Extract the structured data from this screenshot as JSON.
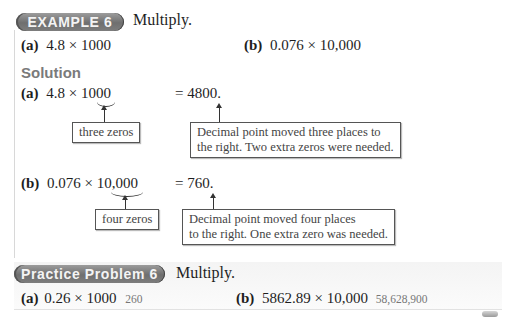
{
  "example": {
    "badge": "EXAMPLE 6",
    "instruction": "Multiply.",
    "parts": [
      {
        "label": "(a)",
        "expression": "4.8 × 1000"
      },
      {
        "label": "(b)",
        "expression": "0.076 × 10,000"
      }
    ]
  },
  "solution": {
    "heading": "Solution",
    "steps": [
      {
        "label": "(a)",
        "expression_prefix": "4.8 × 1",
        "expression_underbraced": "000",
        "result": "= 4800.",
        "note_left": "three zeros",
        "note_right_lines": [
          "Decimal point moved three places to",
          "the right. Two extra zeros were needed."
        ]
      },
      {
        "label": "(b)",
        "expression_prefix": "0.076 × 1",
        "expression_underbraced": "0,000",
        "result": "= 760.",
        "note_left": "four zeros",
        "note_right_lines": [
          "Decimal point moved four places",
          "to the right. One extra zero was needed."
        ]
      }
    ]
  },
  "practice": {
    "badge": "Practice Problem 6",
    "instruction": "Multiply.",
    "parts": [
      {
        "label": "(a)",
        "expression": "0.26 × 1000",
        "answer": "260"
      },
      {
        "label": "(b)",
        "expression": "5862.89 × 10,000",
        "answer": "58,628,900"
      }
    ]
  }
}
